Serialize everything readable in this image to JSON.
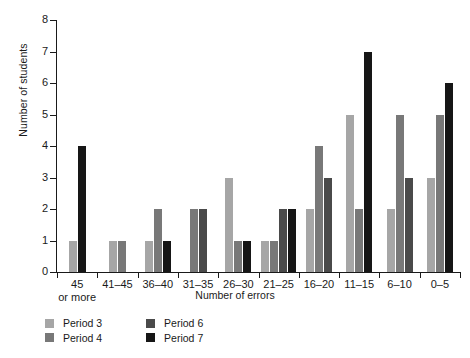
{
  "chart_data": {
    "type": "bar",
    "title": "",
    "xlabel": "Number of errors",
    "ylabel": "Number of students",
    "ylim": [
      0,
      8
    ],
    "ytick_labels": [
      "0",
      "1",
      "2",
      "3",
      "4",
      "5",
      "6",
      "7",
      "8"
    ],
    "grid": false,
    "legend_position": "bottom-left",
    "categories": [
      "45 or more",
      "41–45",
      "36–40",
      "31–35",
      "26–30",
      "21–25",
      "16–20",
      "11–15",
      "6–10",
      "0–5"
    ],
    "category_lines": [
      [
        "45",
        "or more"
      ],
      [
        "41–45",
        ""
      ],
      [
        "36–40",
        ""
      ],
      [
        "31–35",
        ""
      ],
      [
        "26–30",
        ""
      ],
      [
        "21–25",
        ""
      ],
      [
        "16–20",
        ""
      ],
      [
        "11–15",
        ""
      ],
      [
        "6–10",
        ""
      ],
      [
        "0–5",
        ""
      ]
    ],
    "series": [
      {
        "name": "Period 3",
        "color": "#a6a6a6",
        "values": [
          1,
          1,
          1,
          0,
          3,
          1,
          2,
          5,
          2,
          3
        ]
      },
      {
        "name": "Period 4",
        "color": "#787878",
        "values": [
          0,
          1,
          2,
          2,
          1,
          1,
          4,
          2,
          5,
          5
        ]
      },
      {
        "name": "Period 6",
        "color": "#4a4a4a",
        "values": [
          0,
          0,
          0,
          2,
          0,
          2,
          3,
          0,
          3,
          0
        ]
      },
      {
        "name": "Period 7",
        "color": "#161616",
        "values": [
          4,
          0,
          1,
          0,
          1,
          2,
          0,
          7,
          0,
          6
        ]
      }
    ]
  },
  "legend": {
    "column_one": [
      {
        "label": "Period 3",
        "key": "p3"
      },
      {
        "label": "Period 4",
        "key": "p4"
      }
    ],
    "column_two": [
      {
        "label": "Period 6",
        "key": "p6"
      },
      {
        "label": "Period 7",
        "key": "p7"
      }
    ]
  }
}
